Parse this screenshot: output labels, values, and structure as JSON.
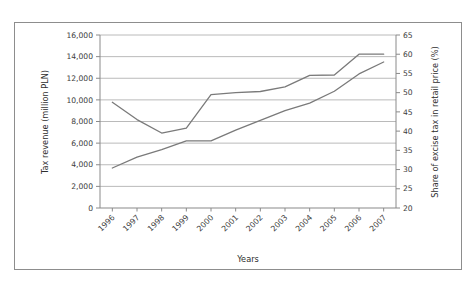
{
  "figure": {
    "background_color": "#ffffff",
    "border_color": "#8d8d8d",
    "plot_line_color": "#7a7a7a",
    "gridline_color": "#a8a8a8",
    "axis_color": "#8a8a8a",
    "text_color": "#3c3c3c"
  },
  "chart_data": {
    "type": "line",
    "title": "",
    "xlabel": "Years",
    "categories": [
      "1996",
      "1997",
      "1998",
      "1999",
      "2000",
      "2001",
      "2002",
      "2003",
      "2004",
      "2005",
      "2006",
      "2007"
    ],
    "x_tick_rotation": -45,
    "grid": true,
    "legend": "none",
    "axes": [
      {
        "id": "left",
        "label": "Tax revenue (million PLN)",
        "unit": "million PLN",
        "lim": [
          0,
          16000
        ],
        "tick_step": 2000,
        "ticks": [
          0,
          2000,
          4000,
          6000,
          8000,
          10000,
          12000,
          14000,
          16000
        ],
        "tick_labels": [
          "0",
          "2,000",
          "4,000",
          "6,000",
          "8,000",
          "10,000",
          "12,000",
          "14,000",
          "16,000"
        ]
      },
      {
        "id": "right",
        "label": "Share of excise tax in retail price (%)",
        "unit": "%",
        "lim": [
          20,
          65
        ],
        "tick_step": 5,
        "ticks": [
          20,
          25,
          30,
          35,
          40,
          45,
          50,
          55,
          60,
          65
        ],
        "tick_labels": [
          "20",
          "25",
          "30",
          "35",
          "40",
          "45",
          "50",
          "55",
          "60",
          "65"
        ]
      }
    ],
    "series": [
      {
        "name": "Tax revenue (million PLN)",
        "axis": "left",
        "color": "#7a7a7a",
        "values": [
          3700,
          4700,
          5400,
          6200,
          6200,
          7200,
          8100,
          9000,
          9700,
          10800,
          12400,
          13500
        ]
      },
      {
        "name": "Share of excise tax in retail price (%)",
        "axis": "right",
        "color": "#7a7a7a",
        "values": [
          47.5,
          43.0,
          39.5,
          40.8,
          49.5,
          50.0,
          50.3,
          51.5,
          54.5,
          54.6,
          60.0,
          60.0
        ]
      }
    ]
  }
}
